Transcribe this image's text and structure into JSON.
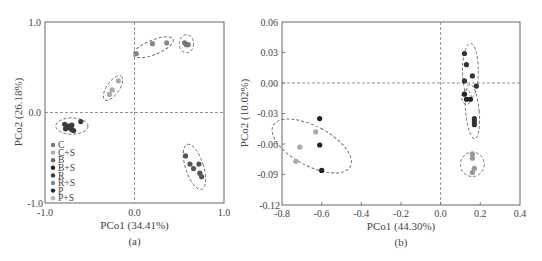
{
  "chart_data": [
    {
      "id": "a",
      "type": "scatter",
      "caption": "(a)",
      "xlabel": "PCo1 (34.41%)",
      "ylabel": "PCo2 (26.18%)",
      "xlim": [
        -1.0,
        1.0
      ],
      "ylim": [
        -1.0,
        1.0
      ],
      "xticks": [
        "-1.0",
        "0.0",
        "1.0"
      ],
      "yticks": [
        "1.0",
        "0.0",
        "-1.0"
      ],
      "grid": false,
      "reference_lines": {
        "x": 0,
        "y": 0,
        "style": "dashed"
      },
      "legend_position": "lower-left inside",
      "legend": [
        {
          "label": "C",
          "color": "#777777"
        },
        {
          "label": "C+S",
          "color": "#aaaaaa"
        },
        {
          "label": "B",
          "color": "#666666"
        },
        {
          "label": "B+S",
          "color": "#222222"
        },
        {
          "label": "R",
          "color": "#3a3a3a"
        },
        {
          "label": "R+S",
          "color": "#888888"
        },
        {
          "label": "P",
          "color": "#2a2a2a"
        },
        {
          "label": "P+S",
          "color": "#b5b5b5"
        }
      ],
      "series": [
        {
          "name": "cluster-upper-right-small",
          "points": [
            [
              0.56,
              0.77
            ],
            [
              0.58,
              0.75
            ],
            [
              0.6,
              0.75
            ]
          ],
          "color": "#777777"
        },
        {
          "name": "cluster-upper-middle",
          "points": [
            [
              0.02,
              0.65
            ],
            [
              0.2,
              0.76
            ],
            [
              0.36,
              0.77
            ]
          ],
          "color": "#888888"
        },
        {
          "name": "cluster-upper-left",
          "points": [
            [
              -0.28,
              0.2
            ],
            [
              -0.25,
              0.25
            ],
            [
              -0.18,
              0.35
            ]
          ],
          "color": "#aaaaaa"
        },
        {
          "name": "cluster-left",
          "points": [
            [
              -0.78,
              -0.13
            ],
            [
              -0.77,
              -0.18
            ],
            [
              -0.74,
              -0.15
            ],
            [
              -0.72,
              -0.17
            ],
            [
              -0.7,
              -0.14
            ],
            [
              -0.68,
              -0.2
            ],
            [
              -0.6,
              -0.1
            ],
            [
              -0.7,
              -0.19
            ]
          ],
          "color": "#3a3a3a"
        },
        {
          "name": "cluster-lower-right",
          "points": [
            [
              0.57,
              -0.48
            ],
            [
              0.62,
              -0.57
            ],
            [
              0.66,
              -0.62
            ],
            [
              0.72,
              -0.57
            ],
            [
              0.73,
              -0.67
            ],
            [
              0.75,
              -0.71
            ]
          ],
          "color": "#555555"
        }
      ],
      "ellipses": [
        {
          "cx": 0.58,
          "cy": 0.76,
          "rx": 0.08,
          "ry": 0.1,
          "angle": 0
        },
        {
          "cx": 0.21,
          "cy": 0.72,
          "rx": 0.24,
          "ry": 0.08,
          "angle": -22
        },
        {
          "cx": -0.24,
          "cy": 0.27,
          "rx": 0.16,
          "ry": 0.07,
          "angle": -55
        },
        {
          "cx": -0.7,
          "cy": -0.15,
          "rx": 0.18,
          "ry": 0.09,
          "angle": 0
        },
        {
          "cx": 0.67,
          "cy": -0.6,
          "rx": 0.1,
          "ry": 0.26,
          "angle": -18
        }
      ]
    },
    {
      "id": "b",
      "type": "scatter",
      "caption": "(b)",
      "xlabel": "PCo1 (44.30%)",
      "ylabel": "PCo2 (10.02%)",
      "xlim": [
        -0.8,
        0.4
      ],
      "ylim": [
        -0.12,
        0.06
      ],
      "xticks": [
        "-0.8",
        "-0.6",
        "-0.4",
        "-0.2",
        "0.0",
        "0.2",
        "0.4"
      ],
      "yticks": [
        "0.06",
        "0.03",
        "0.00",
        "-0.03",
        "-0.06",
        "-0.09",
        "-0.12"
      ],
      "grid": false,
      "reference_lines": {
        "x": 0,
        "y": 0,
        "style": "dashed"
      },
      "series": [
        {
          "name": "cluster-left",
          "points": [
            [
              -0.61,
              -0.035
            ],
            [
              -0.63,
              -0.048
            ],
            [
              -0.61,
              -0.061
            ],
            [
              -0.71,
              -0.063
            ],
            [
              -0.73,
              -0.077
            ],
            [
              -0.6,
              -0.086
            ]
          ],
          "colors": [
            "#222222",
            "#aaaaaa",
            "#222222",
            "#aaaaaa",
            "#aaaaaa",
            "#222222"
          ]
        },
        {
          "name": "cluster-upper-right",
          "points": [
            [
              0.12,
              0.029
            ],
            [
              0.13,
              0.018
            ],
            [
              0.12,
              0.002
            ],
            [
              0.16,
              0.007
            ],
            [
              0.18,
              -0.003
            ]
          ],
          "color": "#333333"
        },
        {
          "name": "cluster-small-ring",
          "points": [
            [
              0.12,
              -0.011
            ],
            [
              0.13,
              -0.016
            ],
            [
              0.15,
              -0.016
            ]
          ],
          "color": "#222222"
        },
        {
          "name": "cluster-right-middle",
          "points": [
            [
              0.17,
              -0.035
            ],
            [
              0.17,
              -0.038
            ],
            [
              0.17,
              -0.041
            ]
          ],
          "color": "#333333"
        },
        {
          "name": "cluster-lower-right",
          "points": [
            [
              0.16,
              -0.07
            ],
            [
              0.16,
              -0.074
            ],
            [
              0.17,
              -0.084
            ],
            [
              0.16,
              -0.088
            ]
          ],
          "color": "#999999"
        }
      ],
      "ellipses": [
        {
          "cx": -0.65,
          "cy": -0.062,
          "rx": 0.1,
          "ry": 0.043,
          "angle": -62
        },
        {
          "cx": 0.15,
          "cy": 0.012,
          "rx": 0.04,
          "ry": 0.027,
          "angle": 0
        },
        {
          "cx": 0.13,
          "cy": -0.014,
          "rx": 0.024,
          "ry": 0.007,
          "angle": 0
        },
        {
          "cx": 0.16,
          "cy": -0.028,
          "rx": 0.034,
          "ry": 0.027,
          "angle": -5
        },
        {
          "cx": 0.16,
          "cy": -0.08,
          "rx": 0.06,
          "ry": 0.012,
          "angle": 0
        }
      ]
    }
  ]
}
